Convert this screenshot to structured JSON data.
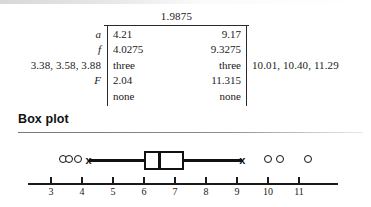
{
  "table": {
    "top_value": "1.9875",
    "rows": [
      {
        "label": "a",
        "italic": true,
        "col1": "4.21",
        "col2": "9.17"
      },
      {
        "label": "f",
        "italic": true,
        "col1": "4.0275",
        "col2": "9.3275"
      },
      {
        "label": "3.38, 3.58, 3.88",
        "italic": false,
        "col1": "three",
        "col2": "three"
      },
      {
        "label": "F",
        "italic": true,
        "col1": "2.04",
        "col2": "11.315"
      },
      {
        "label": "",
        "italic": false,
        "col1": "none",
        "col2": "none"
      }
    ],
    "right_note": "10.01, 10.40, 11.29"
  },
  "boxplot_section": {
    "title": "Box plot"
  },
  "chart_data": {
    "type": "boxplot",
    "title": "Box plot",
    "xlabel": "",
    "ylabel": "",
    "orientation": "horizontal",
    "xlim": [
      2.3,
      12.3
    ],
    "grid": false,
    "legend": "none",
    "axis_ticks": [
      3,
      4,
      5,
      6,
      7,
      8,
      9,
      10,
      11
    ],
    "tick_labels": [
      "3",
      "4",
      "5",
      "6",
      "7",
      "8",
      "9",
      "10",
      "11"
    ],
    "box": {
      "whisker_low": 4.21,
      "q1": 6.0,
      "median": 6.5,
      "q3": 7.3,
      "whisker_high": 9.17,
      "whisker_cap_marker": "x"
    },
    "outliers_low": [
      3.38,
      3.58,
      3.88
    ],
    "outliers_high": [
      10.01,
      10.4,
      11.29
    ],
    "outlier_marker": "circle"
  }
}
